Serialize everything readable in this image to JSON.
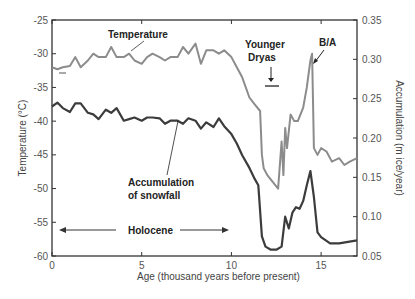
{
  "chart_data": {
    "type": "line",
    "title": "",
    "xlabel": "Age (thousand years before present)",
    "ylabel": "Temperature (°C)",
    "y2label": "Accumulation (m ice/year)",
    "xlim": [
      0,
      17
    ],
    "ylim": [
      -60,
      -25
    ],
    "y2lim": [
      0.05,
      0.35
    ],
    "xticks": [
      "0",
      "5",
      "10",
      "15"
    ],
    "yticks": [
      "-25",
      "-30",
      "-35",
      "-40",
      "-45",
      "-50",
      "-55",
      "-60"
    ],
    "y2ticks": [
      "0.35",
      "0.30",
      "0.25",
      "0.20",
      "0.15",
      "0.10",
      "0.05"
    ],
    "grid": false,
    "legend": "none (inline annotations)",
    "series": [
      {
        "name": "Temperature",
        "axis": "left",
        "color": "#8c8c8c",
        "x": [
          0,
          0.3,
          0.6,
          1.0,
          1.3,
          1.6,
          2.0,
          2.3,
          2.6,
          3.0,
          3.3,
          3.6,
          4.0,
          4.3,
          4.6,
          5.0,
          5.3,
          5.6,
          6.0,
          6.3,
          6.6,
          7.0,
          7.3,
          7.6,
          8.0,
          8.3,
          8.6,
          9.0,
          9.3,
          9.6,
          10.0,
          10.3,
          10.6,
          11.0,
          11.3,
          11.6,
          11.7,
          11.8,
          12.0,
          12.3,
          12.6,
          12.8,
          12.9,
          13.0,
          13.1,
          13.3,
          13.5,
          13.7,
          14.0,
          14.2,
          14.4,
          14.5,
          14.6,
          14.8,
          15.0,
          15.3,
          15.6,
          16.0,
          16.3,
          16.6,
          17.0
        ],
        "values": [
          -32,
          -32.3,
          -32,
          -31.8,
          -30.5,
          -32,
          -31,
          -30,
          -30.5,
          -30.5,
          -29,
          -30.5,
          -30.5,
          -30,
          -31,
          -31.5,
          -30.5,
          -30,
          -30.5,
          -31,
          -30.5,
          -30.5,
          -29,
          -30,
          -28.5,
          -31.5,
          -29.5,
          -29.5,
          -30,
          -29.5,
          -30.5,
          -32,
          -33.5,
          -36.5,
          -37.5,
          -38.5,
          -45,
          -47,
          -48,
          -49,
          -50,
          -43,
          -48,
          -41,
          -44,
          -39,
          -40,
          -40,
          -38,
          -35,
          -31,
          -30,
          -44,
          -45,
          -44,
          -44.5,
          -46,
          -45.5,
          -46.5,
          -46,
          -45.5
        ]
      },
      {
        "name": "Accumulation of snowfall",
        "axis": "right",
        "color": "#3c3c3c",
        "x": [
          0,
          0.3,
          0.6,
          1.0,
          1.3,
          1.6,
          2.0,
          2.3,
          2.6,
          3.0,
          3.3,
          3.6,
          4.0,
          4.3,
          4.6,
          5.0,
          5.3,
          5.6,
          6.0,
          6.3,
          6.6,
          7.0,
          7.3,
          7.6,
          8.0,
          8.3,
          8.6,
          9.0,
          9.3,
          9.6,
          10.0,
          10.3,
          10.6,
          11.0,
          11.3,
          11.5,
          11.7,
          11.9,
          12.2,
          12.5,
          12.8,
          13.0,
          13.2,
          13.4,
          13.6,
          13.8,
          14.0,
          14.2,
          14.4,
          14.6,
          14.8,
          15.0,
          15.5,
          16.0,
          16.5,
          17.0
        ],
        "values": [
          0.24,
          0.245,
          0.238,
          0.233,
          0.244,
          0.244,
          0.232,
          0.23,
          0.224,
          0.236,
          0.232,
          0.238,
          0.222,
          0.224,
          0.226,
          0.222,
          0.226,
          0.226,
          0.225,
          0.218,
          0.222,
          0.222,
          0.218,
          0.225,
          0.222,
          0.212,
          0.22,
          0.214,
          0.225,
          0.215,
          0.205,
          0.193,
          0.178,
          0.162,
          0.148,
          0.14,
          0.075,
          0.062,
          0.058,
          0.058,
          0.062,
          0.1,
          0.085,
          0.105,
          0.112,
          0.11,
          0.12,
          0.14,
          0.158,
          0.125,
          0.08,
          0.074,
          0.066,
          0.066,
          0.068,
          0.07
        ]
      }
    ],
    "annotations": [
      {
        "text": "Temperature",
        "x": 3.2,
        "y": -27.5
      },
      {
        "text": "Younger Dryas",
        "x": 12.3,
        "y": -30,
        "marker": "bar with down arrow, ~11.7–12.9"
      },
      {
        "text": "B/A",
        "x": 14.6,
        "y": -27.5,
        "marker": "arrow to peak at ~14.5"
      },
      {
        "text": "Accumulation of snowfall",
        "x": 6.5,
        "y": -49
      },
      {
        "text": "Holocene",
        "x": 5.2,
        "y": -56,
        "marker": "double arrow 0.3–9.8"
      }
    ]
  },
  "labels": {
    "temperature": "Temperature",
    "younger": "Younger",
    "dryas": "Dryas",
    "ba": "B/A",
    "accum1": "Accumulation",
    "accum2": "of snowfall",
    "holocene": "Holocene",
    "xlabel": "Age (thousand years before present)",
    "ylabel": "Temperature (°C)",
    "y2label": "Accumulation (m ice/year)"
  }
}
